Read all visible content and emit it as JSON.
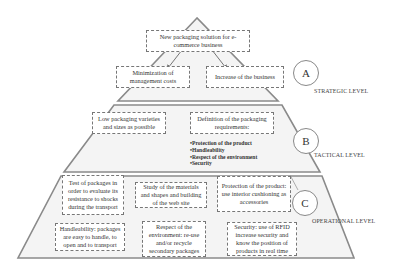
{
  "diagram": {
    "type": "pyramid",
    "levels": [
      {
        "id": "A",
        "label": "STRATEGIC LEVEL",
        "goal": "New packaging solution for e-commerce business",
        "sub_goals": [
          "Minimization of management costs",
          "Increase of the business"
        ]
      },
      {
        "id": "B",
        "label": "TACTICAL LEVEL",
        "items": [
          "Low packaging varieties and sizes as possible",
          "Definition of the packaging requirements:"
        ],
        "requirements": [
          "Protection of the product",
          "Handleability",
          "Respect of the environment",
          "Security"
        ]
      },
      {
        "id": "C",
        "label": "OPERATIONAL LEVEL",
        "items": [
          "Test of packages in order to evaluate its resistance to shocks during the transport",
          "Study of the materials and shapes and building of the web site",
          "Protection of the product: use interior cushioning as accessories",
          "Handleability: packages are easy to handle, to open and to transport",
          "Respect of the environment: re-use and/or recycle secondary packages",
          "Security: use of RFID increase security and know the position of products in real time"
        ]
      }
    ],
    "colors": {
      "pyramid_line": "#8a8a8a",
      "pyramid_fill": "#f4f4f4",
      "box_border": "#777777",
      "text": "#333333"
    }
  }
}
